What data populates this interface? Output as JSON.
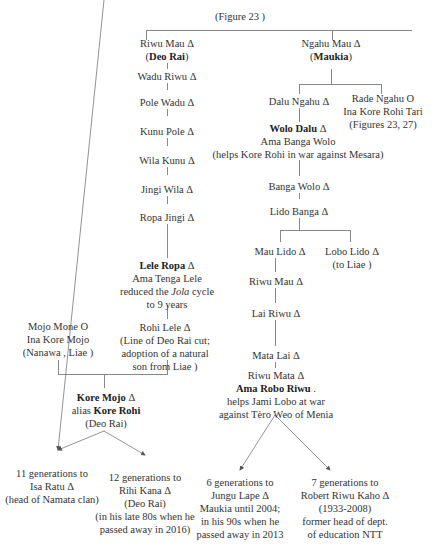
{
  "figure_ref": "(Figure 23 )",
  "left_branch": {
    "root": {
      "name": "Riwu Mau Δ",
      "note": "(Deo Rai)"
    },
    "chain": [
      "Wadu Riwu Δ",
      "Pole Wadu Δ",
      "Kunu Pole Δ",
      "Wila Kunu Δ",
      "Jingi Wila Δ",
      "Ropa Jingi Δ"
    ],
    "lele_ropa": {
      "name": "Lele Ropa",
      "symbol": " Δ",
      "line2": "Ama Tenga Lele",
      "line3_pre": "reduced the ",
      "line3_em": "Jola",
      "line3_post": " cycle",
      "line4": "to 9 years"
    },
    "rohi_lele": {
      "name": "Rohi Lele Δ",
      "line2": "(Line of Deo Rai cut;",
      "line3": "adoption of a natural",
      "line4": "son from Liae )"
    },
    "mojo_mone": {
      "name": "Mojo Mone O",
      "line2": "Ina Kore Mojo",
      "line3": "(Nanawa , Liae )"
    },
    "kore_mojo": {
      "name": "Kore Mojo",
      "symbol": " Δ",
      "alias_label": "alias ",
      "alias": "Kore  Rohi",
      "note": "(Deo Rai)"
    },
    "descendants": [
      {
        "line1": "11 generations to",
        "line2": "Isa Ratu Δ",
        "line3": "(head of Namata clan)"
      },
      {
        "line1": "12 generations to",
        "line2": "Rihi Kana Δ",
        "line3": "(Deo Rai)",
        "line4": "(in his late 80s when he",
        "line5": "passed away in 2016)"
      }
    ]
  },
  "right_branch": {
    "root": {
      "name": "Ngahu Mau Δ",
      "note": "Maukia"
    },
    "dalu_ngahu": "Dalu Ngahu Δ",
    "rade_ngahu": {
      "name": "Rade Ngahu O",
      "line2": "Ina Kore Rohi Tari",
      "line3": "(Figures 23, 27)"
    },
    "wolo_dalu": {
      "name": "Wolo Dalu",
      "symbol": " Δ",
      "line2": "Ama Banga Wolo",
      "line3": "(helps Kore Rohi in war against  Mesara)"
    },
    "chain": [
      "Banga Wolo Δ",
      "Lido Banga Δ"
    ],
    "mau_lido": "Mau Lido Δ",
    "lobo_lido": {
      "name": "Lobo Lido  Δ",
      "line2": "(to Liae )"
    },
    "chain2": [
      "Riwu Mau Δ",
      "Lai Riwu Δ",
      "Mata Lai  Δ"
    ],
    "riwu_mata": {
      "name": "Riwu Mata Δ",
      "line2": "Ama Robo Riwu",
      "line2_post": " .",
      "line3": "helps Jami Lobo at war",
      "line4": "against Tèro Weo of Menia"
    },
    "descendants": [
      {
        "line1": "6 generations to",
        "line2": "Jungu Lape Δ",
        "line3": "Maukia until 2004;",
        "line4": "in his 90s when he",
        "line5": "passed away in 2013"
      },
      {
        "line1": "7 generations to",
        "line2": "Robert Riwu Kaho Δ",
        "line3": "(1933-2008)",
        "line4": "former head of dept.",
        "line5": "of education  NTT"
      }
    ]
  }
}
